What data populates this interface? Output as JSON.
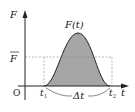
{
  "diagram": {
    "type": "impulse-curve",
    "labels": {
      "y_axis": "F",
      "x_axis": "t",
      "origin": "O",
      "curve": "F(t)",
      "mean_force": "F",
      "t_start": "t",
      "t_start_sub": "1",
      "t_end": "t",
      "t_end_sub": "2",
      "duration": "Δt"
    },
    "colors": {
      "axis": "#222222",
      "fill": "#a6a6a6",
      "dashed": "#888888",
      "brace": "#555555"
    }
  }
}
